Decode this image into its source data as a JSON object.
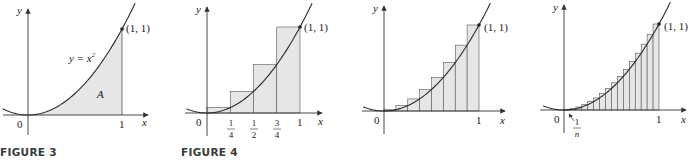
{
  "figures": [
    {
      "id": "figure-3",
      "caption": "FIGURE 3",
      "y_label": "y",
      "x_label": "x",
      "origin_label": "0",
      "point_label": "(1, 1)",
      "curve_label": "y = x",
      "curve_exponent": "2",
      "region_label": "A",
      "x_tick_labels": [
        "1"
      ]
    },
    {
      "id": "figure-4",
      "caption": "FIGURE 4",
      "y_label": "y",
      "x_label": "x",
      "origin_label": "0",
      "point_label": "(1, 1)",
      "x_tick_labels": [
        "1"
      ],
      "fraction_ticks": [
        {
          "num": "1",
          "den": "4"
        },
        {
          "num": "1",
          "den": "2"
        },
        {
          "num": "3",
          "den": "4"
        }
      ],
      "rectangles": 4
    },
    {
      "id": "figure-4-n8",
      "caption": "",
      "y_label": "y",
      "x_label": "x",
      "origin_label": "0",
      "point_label": "(1, 1)",
      "x_tick_labels": [
        "1"
      ],
      "rectangles": 8
    },
    {
      "id": "figure-4-n16",
      "caption": "",
      "y_label": "y",
      "x_label": "x",
      "origin_label": "0",
      "point_label": "(1, 1)",
      "x_tick_labels": [
        "1"
      ],
      "width_label": {
        "num": "1",
        "den": "n"
      },
      "rectangles": 16
    }
  ],
  "colors": {
    "fill": "#e6e6e6",
    "curve": "#2a2a2a",
    "axis": "#333333",
    "rect_stroke": "#555555"
  }
}
